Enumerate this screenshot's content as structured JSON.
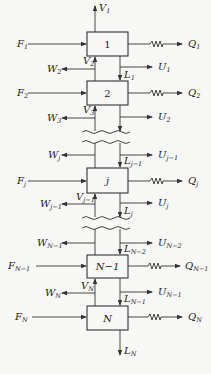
{
  "diagram": {
    "stages": [
      {
        "id": "1",
        "label": "1",
        "feed": {
          "base": "F",
          "sub": "1"
        },
        "heat": {
          "base": "Q",
          "sub": "1"
        }
      },
      {
        "id": "2",
        "label": "2",
        "feed": {
          "base": "F",
          "sub": "2"
        },
        "heat": {
          "base": "Q",
          "sub": "2"
        }
      },
      {
        "id": "j",
        "label": "j",
        "feed": {
          "base": "F",
          "sub": "j"
        },
        "heat": {
          "base": "Q",
          "sub": "j"
        }
      },
      {
        "id": "N-1",
        "label": "N−1",
        "feed": {
          "base": "F",
          "sub": "N−1"
        },
        "heat": {
          "base": "Q",
          "sub": "N−1"
        }
      },
      {
        "id": "N",
        "label": "N",
        "feed": {
          "base": "F",
          "sub": "N"
        },
        "heat": {
          "base": "Q",
          "sub": "N"
        }
      }
    ],
    "vapor_streams": [
      {
        "base": "V",
        "sub": "1"
      },
      {
        "base": "V",
        "sub": "2"
      },
      {
        "base": "V",
        "sub": "3"
      },
      {
        "base": "V",
        "sub": "j−1"
      },
      {
        "base": "V",
        "sub": "N"
      }
    ],
    "liquid_streams": [
      {
        "base": "L",
        "sub": "1"
      },
      {
        "base": "L",
        "sub": "j−1"
      },
      {
        "base": "L",
        "sub": "j"
      },
      {
        "base": "L",
        "sub": "N−2"
      },
      {
        "base": "L",
        "sub": "N−1"
      },
      {
        "base": "L",
        "sub": "N"
      }
    ],
    "vapor_sidedraws": [
      {
        "base": "W",
        "sub": "2"
      },
      {
        "base": "W",
        "sub": "3"
      },
      {
        "base": "W",
        "sub": "j"
      },
      {
        "base": "W",
        "sub": "j−1"
      },
      {
        "base": "W",
        "sub": "N−1"
      },
      {
        "base": "W",
        "sub": "N"
      }
    ],
    "liquid_sidedraws": [
      {
        "base": "U",
        "sub": "1"
      },
      {
        "base": "U",
        "sub": "2"
      },
      {
        "base": "U",
        "sub": "j−1"
      },
      {
        "base": "U",
        "sub": "j"
      },
      {
        "base": "U",
        "sub": "N−2"
      },
      {
        "base": "U",
        "sub": "N−1"
      }
    ],
    "colors": {
      "line": "#333333",
      "background": "#f7f7f5",
      "text": "#222222"
    }
  }
}
